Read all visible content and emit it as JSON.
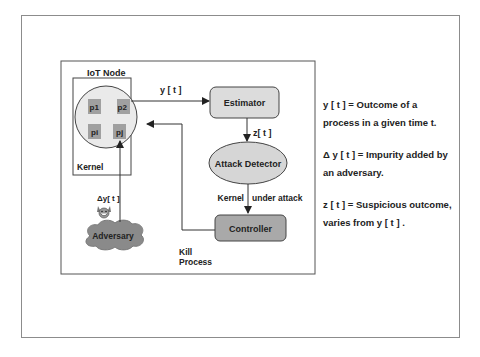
{
  "diagram": {
    "iot_node_label": "IoT Node",
    "kernel_label": "Kernel",
    "processes": [
      "p1",
      "p2",
      "pi",
      "pj"
    ],
    "estimator_label": "Estimator",
    "attack_detector_label": "Attack Detector",
    "controller_label": "Controller",
    "adversary_label": "Adversary",
    "edge_y": "y [ t ]",
    "edge_z": "z[ t ]",
    "edge_delta_y": "Δy[ t ]",
    "edge_kernel": "Kernel",
    "edge_under_attack": "under attack",
    "edge_kill_line1": "Kill",
    "edge_kill_line2": "Process",
    "adversary_icon": "devil-face-icon",
    "colors": {
      "estimator_fill": "#dcdcdc",
      "detector_fill": "#d6d6d6",
      "controller_fill": "#a9a9a9",
      "process_fill": "#a0a0a0",
      "adversary_fill": "#8a8a8a",
      "stroke": "#333333"
    }
  },
  "legend": {
    "items": [
      " y [ t ] = Outcome of a process in a given time t.",
      "Δ y [ t ] = Impurity added by an adversary.",
      " z [ t ] = Suspicious outcome, varies from y [ t ] ."
    ]
  }
}
